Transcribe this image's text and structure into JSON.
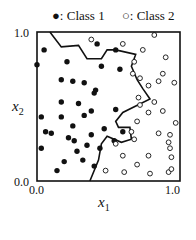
{
  "chart_data": {
    "type": "scatter",
    "title": "",
    "xlabel": "x1",
    "ylabel": "x2",
    "xlim": [
      0.0,
      1.0
    ],
    "ylim": [
      0.0,
      1.0
    ],
    "grid": false,
    "legend_position": "top",
    "x_ticks": [
      "0.0",
      "1.0"
    ],
    "y_ticks": [
      "0.0",
      "1.0"
    ],
    "series": [
      {
        "name": "Class 1",
        "marker": "filled-circle",
        "points": [
          [
            0.05,
            0.88
          ],
          [
            0.0,
            0.78
          ],
          [
            0.21,
            0.8
          ],
          [
            0.25,
            0.67
          ],
          [
            0.17,
            0.68
          ],
          [
            0.33,
            0.66
          ],
          [
            0.17,
            0.53
          ],
          [
            0.03,
            0.43
          ],
          [
            0.17,
            0.43
          ],
          [
            0.33,
            0.44
          ],
          [
            0.4,
            0.59
          ],
          [
            0.45,
            0.77
          ],
          [
            0.55,
            0.88
          ],
          [
            0.38,
            0.31
          ],
          [
            0.25,
            0.37
          ],
          [
            0.06,
            0.33
          ],
          [
            0.26,
            0.27
          ],
          [
            0.19,
            0.13
          ],
          [
            0.35,
            0.24
          ],
          [
            0.47,
            0.35
          ],
          [
            0.55,
            0.48
          ],
          [
            0.58,
            0.75
          ],
          [
            0.42,
            0.92
          ],
          [
            0.41,
            0.61
          ],
          [
            0.03,
            0.22
          ],
          [
            0.14,
            0.07
          ],
          [
            0.28,
            0.2
          ],
          [
            0.22,
            0.29
          ],
          [
            0.32,
            0.14
          ],
          [
            0.44,
            0.22
          ],
          [
            0.4,
            0.1
          ],
          [
            0.54,
            0.27
          ],
          [
            0.29,
            0.52
          ],
          [
            0.1,
            0.32
          ],
          [
            0.38,
            0.47
          ],
          [
            0.6,
            0.33
          ]
        ]
      },
      {
        "name": "Class 2",
        "marker": "open-circle",
        "points": [
          [
            0.38,
            0.95
          ],
          [
            0.6,
            0.92
          ],
          [
            0.82,
            0.98
          ],
          [
            0.9,
            0.83
          ],
          [
            0.74,
            0.88
          ],
          [
            0.68,
            0.8
          ],
          [
            0.88,
            0.72
          ],
          [
            0.85,
            0.67
          ],
          [
            0.67,
            0.72
          ],
          [
            0.72,
            0.69
          ],
          [
            0.78,
            0.64
          ],
          [
            0.96,
            0.66
          ],
          [
            0.71,
            0.56
          ],
          [
            0.82,
            0.53
          ],
          [
            0.88,
            0.47
          ],
          [
            0.72,
            0.51
          ],
          [
            0.97,
            0.39
          ],
          [
            0.78,
            0.46
          ],
          [
            0.7,
            0.4
          ],
          [
            0.85,
            0.32
          ],
          [
            0.93,
            0.31
          ],
          [
            0.68,
            0.28
          ],
          [
            0.92,
            0.26
          ],
          [
            0.93,
            0.22
          ],
          [
            0.94,
            0.16
          ],
          [
            0.78,
            0.17
          ],
          [
            0.7,
            0.11
          ],
          [
            0.6,
            0.17
          ],
          [
            0.55,
            0.25
          ],
          [
            0.61,
            0.06
          ],
          [
            0.79,
            0.05
          ],
          [
            0.92,
            0.06
          ],
          [
            0.94,
            0.08
          ],
          [
            0.48,
            0.07
          ],
          [
            0.66,
            0.33
          ]
        ]
      }
    ],
    "annotations": [
      {
        "type": "decision-boundary",
        "style": "solid-black-line",
        "points": [
          [
            0.09,
            1.0
          ],
          [
            0.17,
            0.9
          ],
          [
            0.29,
            0.91
          ],
          [
            0.35,
            0.82
          ],
          [
            0.45,
            0.82
          ],
          [
            0.49,
            0.88
          ],
          [
            0.55,
            0.88
          ],
          [
            0.69,
            0.85
          ],
          [
            0.66,
            0.77
          ],
          [
            0.7,
            0.68
          ],
          [
            0.74,
            0.62
          ],
          [
            0.79,
            0.55
          ],
          [
            0.6,
            0.46
          ],
          [
            0.55,
            0.4
          ],
          [
            0.57,
            0.36
          ],
          [
            0.65,
            0.36
          ],
          [
            0.66,
            0.28
          ],
          [
            0.59,
            0.26
          ],
          [
            0.49,
            0.3
          ],
          [
            0.45,
            0.25
          ],
          [
            0.43,
            0.14
          ],
          [
            0.37,
            0.0
          ]
        ]
      }
    ]
  },
  "legend": {
    "class1_marker": "●",
    "class1_label": ": Class 1",
    "class2_marker": "○",
    "class2_label": ": Class 2"
  },
  "axes": {
    "x_min_label": "0.0",
    "x_max_label": "1.0",
    "y_min_label": "0.0",
    "y_max_label": "1.0",
    "x_label": "x",
    "x_label_sub": "1",
    "y_label": "x",
    "y_label_sub": "2"
  }
}
